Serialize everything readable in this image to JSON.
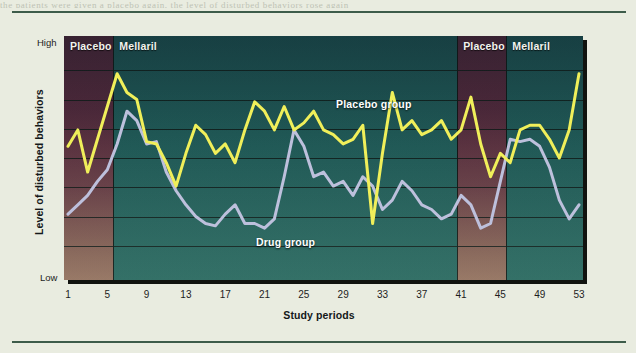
{
  "figure": {
    "top_sliver_text": "the patients were given a placebo again, the level of disturbed behaviors rose again"
  },
  "axes": {
    "y_high_label": "High",
    "y_low_label": "Low",
    "y_axis_title": "Level of disturbed behaviors",
    "x_axis_title": "Study periods",
    "x_ticks": [
      1,
      5,
      9,
      13,
      17,
      21,
      25,
      29,
      33,
      37,
      41,
      45,
      49,
      53
    ]
  },
  "bands": [
    {
      "label": "Placebo",
      "start": 1,
      "end": 5.6,
      "type": "placebo"
    },
    {
      "label": "Mellaril",
      "start": 5.6,
      "end": 40.6,
      "type": "mellaril"
    },
    {
      "label": "Placebo",
      "start": 40.6,
      "end": 45.6,
      "type": "placebo"
    },
    {
      "label": "Mellaril",
      "start": 45.6,
      "end": 53,
      "type": "mellaril"
    }
  ],
  "series_labels": {
    "placebo_group": "Placebo group",
    "drug_group": "Drug group"
  },
  "colors": {
    "placebo_line": "#f0ef5a",
    "drug_line": "#bdc0dc",
    "mellaril_band": "#235d58",
    "placebo_band": "#5c3040",
    "paper": "#e9ece0",
    "rule": "#3d5c4a"
  },
  "chart_data": {
    "type": "line",
    "title": "",
    "xlabel": "Study periods",
    "ylabel": "Level of disturbed behaviors",
    "xlim": [
      1,
      53
    ],
    "ylim": [
      0,
      100
    ],
    "ytick_labels": [
      "Low",
      "High"
    ],
    "grid": true,
    "gridlines_y": [
      12.5,
      25,
      37.5,
      50,
      62.5,
      75,
      87.5
    ],
    "legend": "inline-annotation",
    "x": [
      1,
      2,
      3,
      4,
      5,
      6,
      7,
      8,
      9,
      10,
      11,
      12,
      13,
      14,
      15,
      16,
      17,
      18,
      19,
      20,
      21,
      22,
      23,
      24,
      25,
      26,
      27,
      28,
      29,
      30,
      31,
      32,
      33,
      34,
      35,
      36,
      37,
      38,
      39,
      40,
      41,
      42,
      43,
      44,
      45,
      46,
      47,
      48,
      49,
      50,
      51,
      52,
      53
    ],
    "series": [
      {
        "name": "Placebo group",
        "color": "#f0ef5a",
        "values": [
          55,
          62,
          44,
          58,
          72,
          86,
          78,
          75,
          57,
          56,
          48,
          38,
          52,
          64,
          60,
          52,
          56,
          48,
          62,
          74,
          70,
          62,
          72,
          62,
          65,
          70,
          62,
          60,
          56,
          58,
          64,
          22,
          52,
          78,
          62,
          66,
          60,
          62,
          66,
          58,
          62,
          76,
          56,
          42,
          52,
          48,
          62,
          64,
          64,
          58,
          50,
          62,
          86
        ]
      },
      {
        "name": "Drug group",
        "color": "#bdc0dc",
        "values": [
          26,
          30,
          34,
          40,
          45,
          56,
          70,
          66,
          56,
          57,
          44,
          36,
          30,
          25,
          22,
          21,
          26,
          30,
          22,
          22,
          20,
          24,
          42,
          62,
          55,
          42,
          44,
          38,
          40,
          34,
          42,
          38,
          28,
          32,
          40,
          36,
          30,
          28,
          24,
          26,
          34,
          30,
          20,
          22,
          40,
          58,
          57,
          58,
          55,
          46,
          32,
          24,
          30
        ]
      }
    ]
  }
}
